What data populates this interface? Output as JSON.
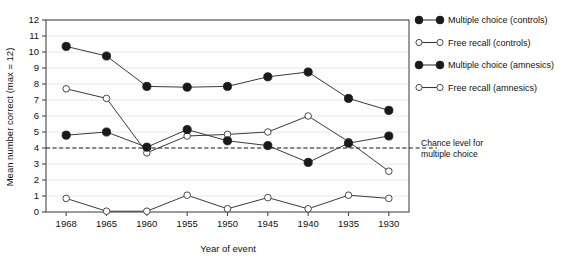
{
  "chart_data": {
    "type": "line",
    "title": "",
    "xlabel": "Year of event",
    "ylabel": "Mean number correct (max = 12)",
    "categories": [
      "1968",
      "1965",
      "1960",
      "1955",
      "1950",
      "1945",
      "1940",
      "1935",
      "1930"
    ],
    "ylim": [
      0,
      12
    ],
    "yticks": [
      "0",
      "1",
      "2",
      "3",
      "4",
      "5",
      "6",
      "7",
      "8",
      "9",
      "10",
      "11",
      "12"
    ],
    "grid": true,
    "legend_position": "right",
    "series": [
      {
        "name": "Multiple choice (controls)",
        "marker": "filled-circle",
        "values": [
          10.35,
          9.75,
          7.85,
          7.8,
          7.85,
          8.45,
          8.75,
          7.1,
          6.35
        ]
      },
      {
        "name": "Free recall (controls)",
        "marker": "open-circle",
        "values": [
          7.7,
          7.1,
          3.7,
          4.75,
          4.85,
          5.0,
          6.0,
          4.4,
          2.55
        ]
      },
      {
        "name": "Multiple choice (amnesics)",
        "marker": "filled-circle",
        "values": [
          4.8,
          5.0,
          4.05,
          5.15,
          4.45,
          4.15,
          3.1,
          4.3,
          4.75
        ]
      },
      {
        "name": "Free recall (amnesics)",
        "marker": "open-circle",
        "values": [
          0.85,
          0.05,
          0.05,
          1.05,
          0.2,
          0.9,
          0.2,
          1.05,
          0.85
        ]
      }
    ],
    "annotations": [
      {
        "text_line1": "Chance level for",
        "text_line2": "multiple choice",
        "reference_line_y": 4,
        "line_style": "dashed"
      }
    ],
    "colors": {
      "line": "#3a3a3a",
      "marker_fill": "#1a1a1a",
      "marker_open_fill": "#ffffff",
      "grid": "#e8e8e8",
      "axis": "#4a4a4a",
      "text": "#111111"
    }
  }
}
